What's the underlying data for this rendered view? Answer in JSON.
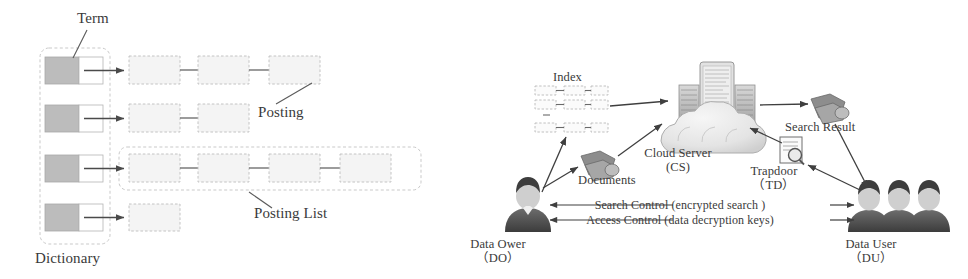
{
  "figure": {
    "palette": {
      "ink": "#3a3a3a",
      "line": "#4a4a4a",
      "term_cell_fill": "#bcbcbc",
      "posting_fill": "#f2f2f2",
      "posting_stroke": "#b9b9b9",
      "group_stroke": "#c4c4c4",
      "person_dark": "#4d4d4d",
      "cloud_fill": "#e9e9e9",
      "server_fill": "#cfcfcf",
      "background": "#ffffff"
    }
  },
  "left_panel": {
    "name": "inverted-index-diagram",
    "labels": {
      "term": "Term",
      "posting": "Posting",
      "posting_list": "Posting List",
      "dictionary": "Dictionary"
    },
    "rows": [
      {
        "term_index": 1,
        "posting_count": 3
      },
      {
        "term_index": 2,
        "posting_count": 2
      },
      {
        "term_index": 3,
        "posting_count": 4
      },
      {
        "term_index": 4,
        "posting_count": 1
      }
    ],
    "highlighted_row_index": 3
  },
  "right_panel": {
    "name": "cloud-search-architecture-diagram",
    "nodes": {
      "index": {
        "label": "Index",
        "icon": "index-grid-icon"
      },
      "documents": {
        "label": "Documents",
        "icon": "documents-stack-icon"
      },
      "cloud_server": {
        "label": "Cloud Server",
        "abbrev": "(CS)",
        "icon": "cloud-server-icon"
      },
      "search_result": {
        "label": "Search Result",
        "icon": "documents-stack-icon"
      },
      "trapdoor": {
        "label": "Trapdoor",
        "abbrev": "（TD）",
        "icon": "document-magnifier-icon"
      },
      "data_owner": {
        "label": "Data Ower",
        "abbrev": "（DO）",
        "icon": "person-icon"
      },
      "data_user": {
        "label": "Data User",
        "abbrev": "（DU）",
        "icon": "three-people-icon"
      }
    },
    "control_channels": [
      {
        "id": "search-control",
        "text": "Search Control (encrypted search )"
      },
      {
        "id": "access-control",
        "text": "Access Control (data decryption keys)"
      }
    ],
    "flows": [
      {
        "from": "data_owner",
        "to": "index"
      },
      {
        "from": "data_owner",
        "to": "documents"
      },
      {
        "from": "index",
        "to": "cloud_server"
      },
      {
        "from": "documents",
        "to": "cloud_server"
      },
      {
        "from": "cloud_server",
        "to": "search_result"
      },
      {
        "from": "search_result",
        "to": "data_user"
      },
      {
        "from": "data_user",
        "to": "trapdoor"
      },
      {
        "from": "trapdoor",
        "to": "cloud_server"
      }
    ]
  }
}
